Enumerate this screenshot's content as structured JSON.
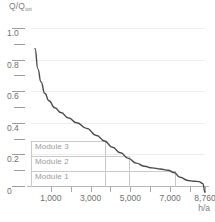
{
  "chart_data": {
    "type": "line",
    "title": "",
    "ylabel": "Q/Q",
    "ylabel_sub": "tot",
    "xlabel": "h/a",
    "xlim": [
      0,
      8760
    ],
    "ylim": [
      0,
      1.0
    ],
    "grid": true,
    "legend": "none",
    "y_ticks": [
      {
        "value": 1.0,
        "label": "1.0",
        "major": true
      },
      {
        "value": 0.9,
        "label": "",
        "major": false
      },
      {
        "value": 0.8,
        "label": "0.8",
        "major": true
      },
      {
        "value": 0.7,
        "label": "",
        "major": false
      },
      {
        "value": 0.6,
        "label": "0.6",
        "major": true
      },
      {
        "value": 0.5,
        "label": "",
        "major": false
      },
      {
        "value": 0.4,
        "label": "0.4",
        "major": true
      },
      {
        "value": 0.3,
        "label": "",
        "major": false
      },
      {
        "value": 0.2,
        "label": "0.2",
        "major": true
      },
      {
        "value": 0.1,
        "label": "",
        "major": false
      },
      {
        "value": 0.0,
        "label": "0",
        "major": true
      }
    ],
    "y_gridlines": [
      1.0,
      0.8,
      0.6,
      0.4,
      0.2,
      0.0
    ],
    "x_ticks": [
      {
        "value": 1000,
        "label": "1,000"
      },
      {
        "value": 2000,
        "label": ""
      },
      {
        "value": 3000,
        "label": "3,000"
      },
      {
        "value": 4000,
        "label": ""
      },
      {
        "value": 5000,
        "label": "5,000"
      },
      {
        "value": 6000,
        "label": ""
      },
      {
        "value": 7000,
        "label": "7,000"
      },
      {
        "value": 8000,
        "label": ""
      },
      {
        "value": 8760,
        "label": "8,760"
      }
    ],
    "series": [
      {
        "name": "load-duration-curve",
        "color": "#4a4a4a",
        "x": [
          200,
          350,
          500,
          700,
          900,
          1200,
          1500,
          1900,
          2300,
          2800,
          3300,
          3700,
          4100,
          4500,
          4900,
          5300,
          5700,
          6100,
          6500,
          6900,
          7200,
          7500,
          7900,
          8200,
          8450,
          8650,
          8760
        ],
        "y": [
          0.87,
          0.74,
          0.66,
          0.585,
          0.54,
          0.495,
          0.465,
          0.43,
          0.4,
          0.365,
          0.32,
          0.285,
          0.245,
          0.21,
          0.175,
          0.145,
          0.125,
          0.115,
          0.108,
          0.1,
          0.085,
          0.055,
          0.035,
          0.03,
          0.028,
          0.015,
          -0.04
        ]
      }
    ],
    "modules": [
      {
        "label": "Module 3",
        "y_top": 0.285,
        "x_right": 3700,
        "label_y": 0.255
      },
      {
        "label": "Module 2",
        "y_top": 0.19,
        "x_right": 4900,
        "label_y": 0.16
      },
      {
        "label": "Module 1",
        "y_top": 0.095,
        "x_right": 7200,
        "label_y": 0.065
      }
    ]
  }
}
